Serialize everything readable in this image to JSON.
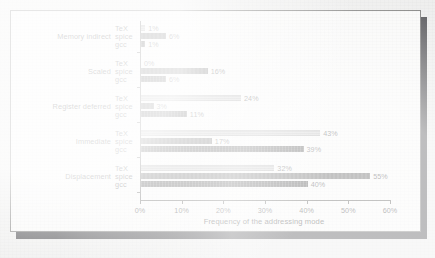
{
  "chart_data": {
    "type": "bar",
    "orientation": "horizontal",
    "title": "",
    "xlabel": "Frequency of the addressing mode",
    "ylabel": "",
    "xlim": [
      0,
      60
    ],
    "xticks": [
      "0%",
      "10%",
      "20%",
      "30%",
      "40%",
      "50%",
      "60%"
    ],
    "xtick_values": [
      0,
      10,
      20,
      30,
      40,
      50,
      60
    ],
    "grid": false,
    "legend": "inline-series-labels",
    "categories": [
      "Memory indirect",
      "Scaled",
      "Register deferred",
      "Immediate",
      "Displacement"
    ],
    "series": [
      {
        "name": "TeX",
        "color": "#adadad",
        "values": [
          1,
          0,
          24,
          43,
          32
        ],
        "labels": [
          "1%",
          "0%",
          "24%",
          "43%",
          "32%"
        ]
      },
      {
        "name": "spice",
        "color": "#3b3b3b",
        "values": [
          6,
          16,
          3,
          17,
          55
        ],
        "labels": [
          "6%",
          "16%",
          "3%",
          "17%",
          "55%"
        ]
      },
      {
        "name": "gcc",
        "color": "#1f1f1f",
        "values": [
          1,
          6,
          11,
          39,
          40
        ],
        "labels": [
          "1%",
          "6%",
          "11%",
          "39%",
          "40%"
        ]
      }
    ]
  },
  "figure": {
    "frame_border_color": "#60605e",
    "plot_background": "#f7f7f6",
    "page_background": "#e9e9e8",
    "shadow_color": "#26262a"
  }
}
